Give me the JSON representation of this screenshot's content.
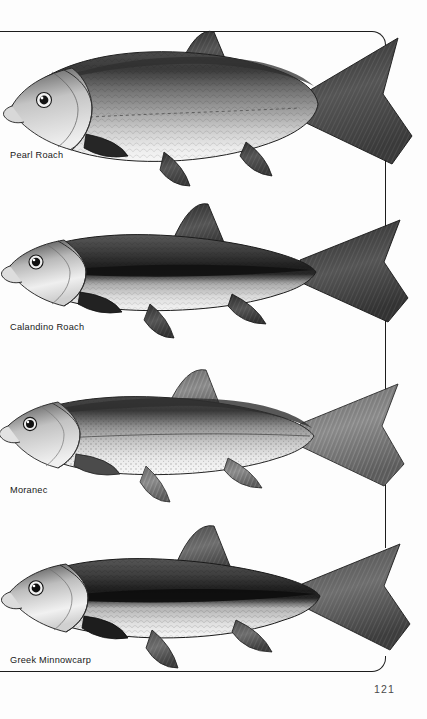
{
  "page": {
    "number": "121",
    "background_color": "#fdfdfd",
    "ink_color": "#1c1c1c",
    "border": {
      "style": "rounded-rectangle-open-left",
      "top_y": 31,
      "bottom_y": 672,
      "right_x": 386,
      "corner_radius": 14
    }
  },
  "plates": [
    {
      "index": 1,
      "label": "Pearl Roach",
      "label_x": 10,
      "label_y": 150,
      "illustration": "lateral-view-fish-engraving",
      "notes": "deep-bodied silvery roach with dark back, large scales, forked caudal fin crossing the frame rule",
      "body_top": 20,
      "body_bottom": 185,
      "tone": "grayscale-stipple-engraving"
    },
    {
      "index": 2,
      "label": "Calandino Roach",
      "label_x": 10,
      "label_y": 322,
      "illustration": "lateral-view-fish-engraving",
      "notes": "slender fish with bold dark lateral stripe, bright silver gill cover, dark dorsal and caudal fins",
      "body_top": 205,
      "body_bottom": 352,
      "tone": "grayscale-stipple-engraving"
    },
    {
      "index": 3,
      "label": "Moranec",
      "label_x": 10,
      "label_y": 485,
      "illustration": "lateral-view-fish-engraving",
      "notes": "speckled olive-backed fish, pale belly, fine dark mottling over flank, forked tail",
      "body_top": 375,
      "body_bottom": 512,
      "tone": "grayscale-stipple-engraving"
    },
    {
      "index": 4,
      "label": "Greek Minnowcarp",
      "label_x": 10,
      "label_y": 655,
      "illustration": "lateral-view-fish-engraving",
      "notes": "minnow-like carp with heavy black midlateral band, scaly flanks and dark-rayed fins",
      "body_top": 525,
      "body_bottom": 680,
      "tone": "grayscale-stipple-engraving"
    }
  ]
}
